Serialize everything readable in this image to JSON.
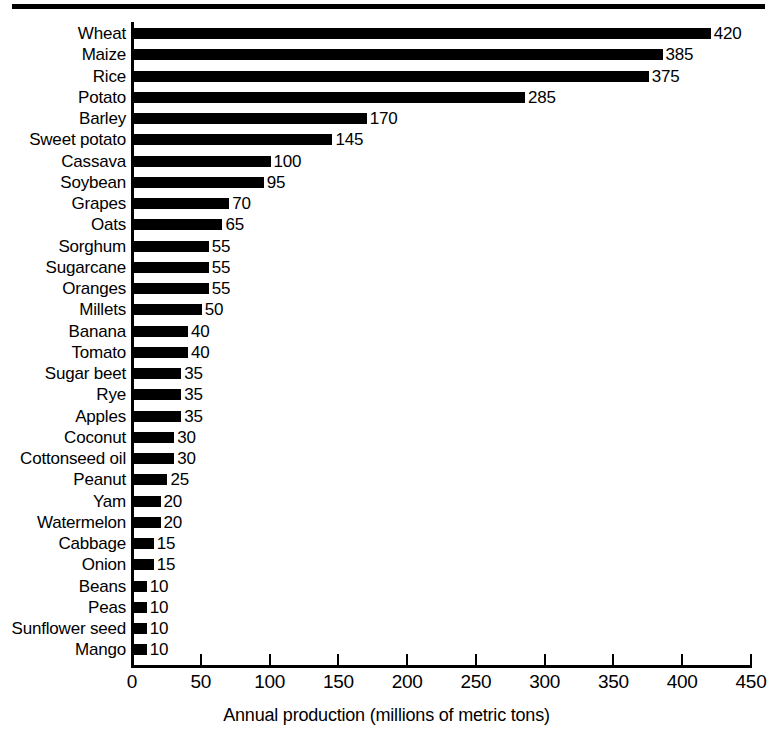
{
  "chart_data": {
    "type": "bar",
    "orientation": "horizontal",
    "title": "",
    "subtitle": "",
    "xlabel": "Annual production (millions of metric tons)",
    "ylabel": "",
    "xlim": [
      0,
      450
    ],
    "xticks": [
      0,
      50,
      100,
      150,
      200,
      250,
      300,
      350,
      400,
      450
    ],
    "grid": false,
    "legend": null,
    "bar_color": "#000000",
    "background_color": "#ffffff",
    "value_labels_shown": true,
    "categories": [
      "Wheat",
      "Maize",
      "Rice",
      "Potato",
      "Barley",
      "Sweet potato",
      "Cassava",
      "Soybean",
      "Grapes",
      "Oats",
      "Sorghum",
      "Sugarcane",
      "Oranges",
      "Millets",
      "Banana",
      "Tomato",
      "Sugar beet",
      "Rye",
      "Apples",
      "Coconut",
      "Cottonseed oil",
      "Peanut",
      "Yam",
      "Watermelon",
      "Cabbage",
      "Onion",
      "Beans",
      "Peas",
      "Sunflower seed",
      "Mango"
    ],
    "values": [
      420,
      385,
      375,
      285,
      170,
      145,
      100,
      95,
      70,
      65,
      55,
      55,
      55,
      50,
      40,
      40,
      35,
      35,
      35,
      30,
      30,
      25,
      20,
      20,
      15,
      15,
      10,
      10,
      10,
      10
    ]
  }
}
